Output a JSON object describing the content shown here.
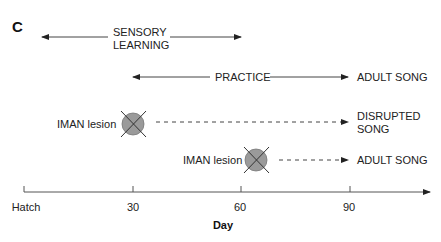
{
  "panel_label": "C",
  "phases": {
    "sensory": {
      "line1": "SENSORY",
      "line2": "LEARNING"
    },
    "practice": {
      "label": "PRACTICE",
      "outcome": "ADULT SONG"
    }
  },
  "lesions": [
    {
      "label": "IMAN lesion",
      "day": 30,
      "outcome_line1": "DISRUPTED",
      "outcome_line2": "SONG"
    },
    {
      "label": "IMAN lesion",
      "day": 65,
      "outcome": "ADULT SONG"
    }
  ],
  "axis": {
    "title": "Day",
    "ticks": [
      "Hatch",
      "30",
      "60",
      "90"
    ]
  },
  "colors": {
    "line": "#333333",
    "lesion_fill": "#999999",
    "text": "#222222"
  }
}
